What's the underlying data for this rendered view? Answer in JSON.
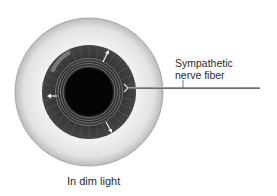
{
  "figure": {
    "caption": "In dim light",
    "labels": {
      "nerve_line1": "Sympathetic",
      "nerve_line2": "nerve fiber"
    },
    "elements": {
      "eyeball": {
        "cx": 89,
        "cy": 92,
        "r": 74,
        "color": "#e8e8e8"
      },
      "iris": {
        "cx": 89,
        "cy": 92,
        "r": 47,
        "color": "#3a3a3a"
      },
      "sphincter_rings": [
        26,
        28.5,
        31,
        33.5
      ],
      "pupil": {
        "cx": 89,
        "cy": 92,
        "r": 24,
        "color": "#050505"
      },
      "nerve_fiber": {
        "x1": 128,
        "y1": 88,
        "x2": 260,
        "y2": 88,
        "color": "#7a7a7a"
      },
      "dilation_arrows": [
        "up-right",
        "left",
        "down-right"
      ]
    }
  }
}
